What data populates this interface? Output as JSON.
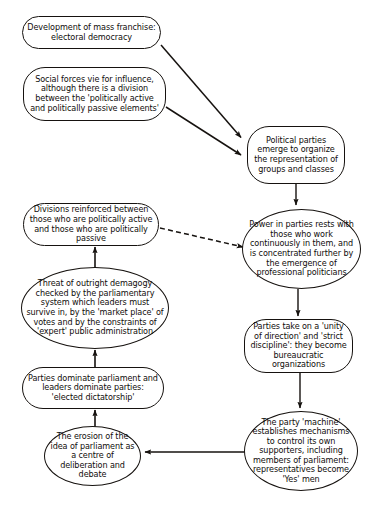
{
  "diagram": {
    "type": "flowchart",
    "background_color": "#ffffff",
    "line_color": "#16120f",
    "text_color": "#100d0b",
    "nodes": [
      {
        "id": "n1",
        "label": "Development of mass franchise: electoral democracy",
        "shape": "rounded",
        "x": 22,
        "y": 16,
        "w": 139,
        "h": 33
      },
      {
        "id": "n2",
        "label": "Social forces vie for influence, although there is a division between the 'politically active and politically passive elements'",
        "shape": "rounded",
        "x": 23,
        "y": 67,
        "w": 143,
        "h": 54
      },
      {
        "id": "n3",
        "label": "Political parties emerge to organize the representation of groups and classes",
        "shape": "rounded",
        "x": 247,
        "y": 126,
        "w": 98,
        "h": 58
      },
      {
        "id": "n4",
        "label": "Divisions reinforced between those who are politically active and those who are politically passive",
        "shape": "rounded",
        "x": 23,
        "y": 203,
        "w": 136,
        "h": 43
      },
      {
        "id": "n5",
        "label": "Power in parties rests with those who work continuously in them, and is concentrated further by the emergence of professional politicians",
        "shape": "ellipse",
        "x": 242,
        "y": 209,
        "w": 119,
        "h": 80
      },
      {
        "id": "n6",
        "label": "Threat of outright demagogy checked by the parliamentary system which leaders must survive in, by the 'market place' of votes and by the constraints of 'expert' public administration",
        "shape": "ellipse",
        "x": 21,
        "y": 267,
        "w": 148,
        "h": 82
      },
      {
        "id": "n7",
        "label": "Parties take on a 'unity of direction' and 'strict discipline': they become bureaucratic organizations",
        "shape": "rounded",
        "x": 244,
        "y": 319,
        "w": 109,
        "h": 54
      },
      {
        "id": "n8",
        "label": "Parties dominate parliament and leaders dominate parties: 'elected dictatorship'",
        "shape": "rounded",
        "x": 22,
        "y": 367,
        "w": 142,
        "h": 42
      },
      {
        "id": "n9",
        "label": "The party 'machine' establishes mechanisms to control its own supporters, including members of parliament: representatives become 'Yes' men",
        "shape": "ellipse",
        "x": 244,
        "y": 411,
        "w": 114,
        "h": 80
      },
      {
        "id": "n10",
        "label": "The erosion of the idea of parliament as a centre of deliberation and debate",
        "shape": "ellipse",
        "x": 44,
        "y": 426,
        "w": 97,
        "h": 60
      }
    ],
    "edges": [
      {
        "id": "e1",
        "from": "n1",
        "to": "n3",
        "style": "solid",
        "points": "161,45 244,140"
      },
      {
        "id": "e2",
        "from": "n2",
        "to": "n3",
        "style": "solid",
        "points": "166,106 244,157"
      },
      {
        "id": "e3",
        "from": "n3",
        "to": "n5",
        "style": "solid",
        "points": "296,184 296,206"
      },
      {
        "id": "e4",
        "from": "n4",
        "to": "n5",
        "style": "dashed",
        "points": "159,228 240,248"
      },
      {
        "id": "e5",
        "from": "n6",
        "to": "n4",
        "style": "solid",
        "points": "95,267 95,249"
      },
      {
        "id": "e6",
        "from": "n8",
        "to": "n6",
        "style": "solid",
        "points": "95,367 95,352"
      },
      {
        "id": "e7",
        "from": "n10",
        "to": "n8",
        "style": "solid",
        "points": "95,427 95,412"
      },
      {
        "id": "e8",
        "from": "n5",
        "to": "n7",
        "style": "solid",
        "points": "298,289 298,316"
      },
      {
        "id": "e9",
        "from": "n7",
        "to": "n9",
        "style": "solid",
        "points": "300,373 300,408"
      },
      {
        "id": "e10",
        "from": "n9",
        "to": "n10",
        "style": "solid",
        "points": "244,452 144,452"
      }
    ]
  }
}
